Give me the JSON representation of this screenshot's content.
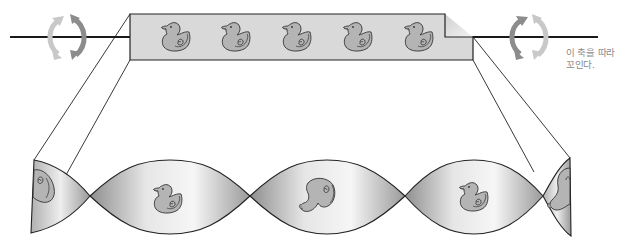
{
  "figure": {
    "axis_label_line1": "이 축을 따라",
    "axis_label_line2": "꼬인다.",
    "flat_strip": {
      "duck_count": 5,
      "duck_x": [
        176,
        236,
        297,
        358,
        419
      ],
      "fill_color": "#d9d9d9"
    },
    "twisted_ribbon": {
      "crossing_points_x": [
        90,
        250,
        405,
        543
      ],
      "lobes": [
        {
          "center_x": 170,
          "content": "duck-facing-left"
        },
        {
          "center_x": 327,
          "content": "duck-twisted-back-view"
        },
        {
          "center_x": 474,
          "content": "duck-facing-left"
        }
      ],
      "partial_lobes": [
        {
          "side": "left",
          "content": "duck-wing-partial"
        },
        {
          "side": "right",
          "content": "duck-twisted-partial"
        }
      ]
    },
    "rotation_arrows": [
      {
        "side": "left",
        "center_x": 63,
        "center_y": 37
      },
      {
        "side": "right",
        "center_x": 528,
        "center_y": 37
      }
    ],
    "colors": {
      "axis_line": "#1a1a1a",
      "arrow_dark": "#8c8c8c",
      "arrow_light": "#c8c8c8",
      "strip_fill": "#d9d9d9",
      "duck_fill": "#b4b4b4",
      "outline": "#333333",
      "label_text": "#8a8a8a"
    }
  }
}
